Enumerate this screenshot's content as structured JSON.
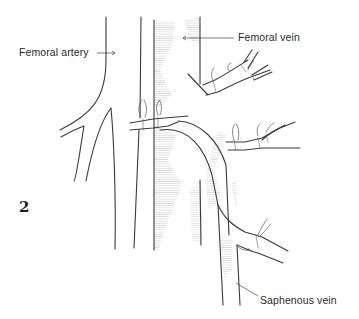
{
  "figure": {
    "number": "2",
    "labels": {
      "femoral_artery": "Femoral artery",
      "femoral_vein": "Femoral vein",
      "saphenous_vein": "Saphenous vein"
    }
  },
  "colors": {
    "line": "#3a3a3a",
    "hatch": "#b8b8b8",
    "background": "#ffffff"
  }
}
